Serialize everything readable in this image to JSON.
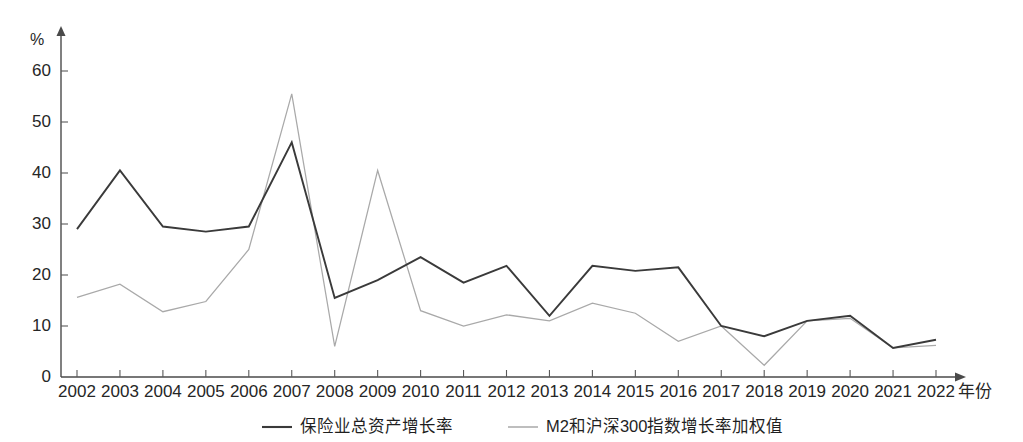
{
  "chart_data": {
    "type": "line",
    "title": "",
    "xlabel": "年份",
    "ylabel": "%",
    "ylim": [
      0,
      65
    ],
    "yticks": [
      0,
      10,
      20,
      30,
      40,
      50,
      60
    ],
    "grid": false,
    "legend_position": "bottom",
    "categories": [
      "2002",
      "2003",
      "2004",
      "2005",
      "2006",
      "2007",
      "2008",
      "2009",
      "2010",
      "2011",
      "2012",
      "2013",
      "2014",
      "2015",
      "2016",
      "2017",
      "2018",
      "2019",
      "2020",
      "2021",
      "2022"
    ],
    "series": [
      {
        "name": "保险业总资产增长率",
        "color": "#3a3a3a",
        "values": [
          29.0,
          40.5,
          29.5,
          28.5,
          29.5,
          46.0,
          15.5,
          19.0,
          23.5,
          18.5,
          21.8,
          12.0,
          21.8,
          20.8,
          21.5,
          10.0,
          8.0,
          11.0,
          12.0,
          5.7,
          7.3
        ]
      },
      {
        "name": "M2和沪深300指数增长率加权值",
        "color": "#a9a9a9",
        "values": [
          15.6,
          18.2,
          12.8,
          14.8,
          25.0,
          55.5,
          6.0,
          40.5,
          13.0,
          10.0,
          12.2,
          11.0,
          14.5,
          12.5,
          7.0,
          10.0,
          2.3,
          11.0,
          11.5,
          5.7,
          6.2
        ]
      }
    ]
  },
  "axes": {
    "unit_label": "%",
    "x_axis_title": "年份",
    "y_tick_labels": [
      "60",
      "50",
      "40",
      "30",
      "20",
      "10",
      "0"
    ]
  },
  "legend": {
    "items": [
      {
        "label": "保险业总资产增长率",
        "color": "#3a3a3a"
      },
      {
        "label": "M2和沪深300指数增长率加权值",
        "color": "#a9a9a9"
      }
    ]
  }
}
